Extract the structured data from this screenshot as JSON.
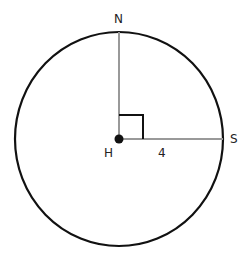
{
  "diagram": {
    "type": "circle-geometry",
    "center": {
      "label": "H",
      "x": 119,
      "y": 139
    },
    "circle": {
      "rx": 104,
      "ry": 107,
      "stroke": "#111111"
    },
    "points": [
      {
        "label": "N",
        "position": "top"
      },
      {
        "label": "S",
        "position": "right"
      }
    ],
    "segments": [
      {
        "from": "H",
        "to": "N",
        "color": "#999999"
      },
      {
        "from": "H",
        "to": "S",
        "color": "#999999",
        "length_label": "4"
      }
    ],
    "right_angle_marker": {
      "at": "H",
      "between": [
        "N",
        "S"
      ]
    }
  },
  "labels": {
    "n": "N",
    "s": "S",
    "h": "H",
    "radius": "4"
  }
}
